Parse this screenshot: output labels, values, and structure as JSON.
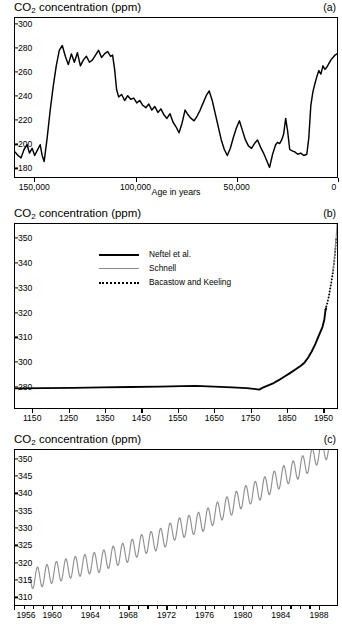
{
  "figure": {
    "background": "#ffffff",
    "line_color": "#000000",
    "secondary_line_color": "#8a8a8a"
  },
  "panels": [
    {
      "tag": "(a)",
      "axis_title_main": "CO",
      "axis_title_sub": "2",
      "axis_title_rest": " concentration (ppm)",
      "xlabel": "Age in years",
      "yticks": [
        "300",
        "280",
        "260",
        "240",
        "220",
        "200",
        "180"
      ],
      "xticks": [
        "150,000",
        "100,000",
        "50,000",
        "0"
      ]
    },
    {
      "tag": "(b)",
      "axis_title_main": "CO",
      "axis_title_sub": "2",
      "axis_title_rest": " concentration (ppm)",
      "xlabel": "",
      "yticks": [
        "350",
        "340",
        "330",
        "320",
        "310",
        "300",
        "280"
      ],
      "xticks": [
        "1150",
        "1250",
        "1350",
        "1450",
        "1550",
        "1650",
        "1750",
        "1850",
        "1950"
      ],
      "legend": [
        {
          "label": "Neftel et  al.",
          "style": "solid"
        },
        {
          "label": "Schnell",
          "style": "thin-gray"
        },
        {
          "label": "Bacastow and Keeling",
          "style": "dotted"
        }
      ]
    },
    {
      "tag": "(c)",
      "axis_title_main": "CO",
      "axis_title_sub": "2",
      "axis_title_rest": " concentration (ppm)",
      "xlabel": "",
      "yticks": [
        "350",
        "345",
        "340",
        "335",
        "330",
        "325",
        "320",
        "315",
        "310"
      ],
      "xticks": [
        "1956",
        "1960",
        "1964",
        "1968",
        "1972",
        "1976",
        "1980",
        "1984",
        "1988"
      ]
    }
  ],
  "chart_data": [
    {
      "type": "line",
      "panel": "(a)",
      "title": "CO2 concentration (ppm)",
      "xlabel": "Age in years",
      "ylabel": "CO2 concentration (ppm)",
      "xlim": [
        160000,
        0
      ],
      "ylim": [
        172,
        305
      ],
      "x_reversed": true,
      "grid": false,
      "legend": "none",
      "series": [
        {
          "name": "Vostok ice core CO2",
          "points": [
            [
              160000,
              193
            ],
            [
              158500,
              190
            ],
            [
              157000,
              188
            ],
            [
              155500,
              195
            ],
            [
              154000,
              199
            ],
            [
              152800,
              192
            ],
            [
              151500,
              196
            ],
            [
              150200,
              190
            ],
            [
              149000,
              194
            ],
            [
              147500,
              199
            ],
            [
              146500,
              190
            ],
            [
              145500,
              185
            ],
            [
              144000,
              205
            ],
            [
              142500,
              228
            ],
            [
              141000,
              248
            ],
            [
              139500,
              265
            ],
            [
              138000,
              278
            ],
            [
              136500,
              282
            ],
            [
              135000,
              273
            ],
            [
              133500,
              266
            ],
            [
              132000,
              275
            ],
            [
              130500,
              268
            ],
            [
              129000,
              276
            ],
            [
              127500,
              265
            ],
            [
              126000,
              270
            ],
            [
              124500,
              273
            ],
            [
              123000,
              268
            ],
            [
              121500,
              270
            ],
            [
              120000,
              274
            ],
            [
              118500,
              278
            ],
            [
              117000,
              272
            ],
            [
              115500,
              275
            ],
            [
              114000,
              277
            ],
            [
              112500,
              273
            ],
            [
              111500,
              274
            ],
            [
              110500,
              262
            ],
            [
              109500,
              245
            ],
            [
              108500,
              239
            ],
            [
              107000,
              241
            ],
            [
              105500,
              236
            ],
            [
              104000,
              240
            ],
            [
              102500,
              237
            ],
            [
              101000,
              238
            ],
            [
              99500,
              234
            ],
            [
              98000,
              236
            ],
            [
              96500,
              232
            ],
            [
              95000,
              230
            ],
            [
              93500,
              233
            ],
            [
              92000,
              228
            ],
            [
              90500,
              231
            ],
            [
              89000,
              226
            ],
            [
              87500,
              229
            ],
            [
              86000,
              224
            ],
            [
              84500,
              221
            ],
            [
              83000,
              225
            ],
            [
              81500,
              218
            ],
            [
              80000,
              214
            ],
            [
              78500,
              209
            ],
            [
              77000,
              217
            ],
            [
              75500,
              228
            ],
            [
              74000,
              224
            ],
            [
              72500,
              221
            ],
            [
              71000,
              219
            ],
            [
              69500,
              223
            ],
            [
              68000,
              228
            ],
            [
              66500,
              234
            ],
            [
              65000,
              240
            ],
            [
              63500,
              244
            ],
            [
              62000,
              236
            ],
            [
              60500,
              225
            ],
            [
              59000,
              214
            ],
            [
              57500,
              203
            ],
            [
              56000,
              195
            ],
            [
              54500,
              190
            ],
            [
              53000,
              196
            ],
            [
              51500,
              205
            ],
            [
              50000,
              213
            ],
            [
              48500,
              219
            ],
            [
              47000,
              211
            ],
            [
              45500,
              203
            ],
            [
              44000,
              198
            ],
            [
              42500,
              196
            ],
            [
              41000,
              200
            ],
            [
              39500,
              203
            ],
            [
              38000,
              197
            ],
            [
              36500,
              192
            ],
            [
              35000,
              186
            ],
            [
              33500,
              180
            ],
            [
              32000,
              191
            ],
            [
              30500,
              199
            ],
            [
              29500,
              201
            ],
            [
              28500,
              200
            ],
            [
              27500,
              203
            ],
            [
              26500,
              208
            ],
            [
              25500,
              221
            ],
            [
              24500,
              210
            ],
            [
              23500,
              195
            ],
            [
              22500,
              194
            ],
            [
              21000,
              193
            ],
            [
              19500,
              191
            ],
            [
              18000,
              192
            ],
            [
              16500,
              190
            ],
            [
              15000,
              191
            ],
            [
              14000,
              205
            ],
            [
              13000,
              232
            ],
            [
              12000,
              243
            ],
            [
              11000,
              250
            ],
            [
              10000,
              256
            ],
            [
              9000,
              261
            ],
            [
              8000,
              258
            ],
            [
              7000,
              265
            ],
            [
              6000,
              262
            ],
            [
              5000,
              264
            ],
            [
              4000,
              267
            ],
            [
              3000,
              270
            ],
            [
              2000,
              272
            ],
            [
              1000,
              274
            ],
            [
              0,
              275
            ]
          ]
        }
      ]
    },
    {
      "type": "line",
      "panel": "(b)",
      "title": "CO2 concentration (ppm)",
      "xlabel": "",
      "ylabel": "CO2 concentration (ppm)",
      "xlim": [
        1100,
        1990
      ],
      "ylim": [
        274,
        358
      ],
      "grid": false,
      "legend": "upper-left-inside",
      "series": [
        {
          "name": "Neftel et  al.",
          "style": "solid",
          "color": "#000000",
          "points": [
            [
              1100,
              278.2
            ],
            [
              1180,
              278.4
            ],
            [
              1260,
              278.6
            ],
            [
              1340,
              279.0
            ],
            [
              1420,
              279.3
            ],
            [
              1500,
              279.6
            ],
            [
              1560,
              280.0
            ],
            [
              1600,
              280.2
            ],
            [
              1650,
              279.6
            ],
            [
              1700,
              279.0
            ],
            [
              1740,
              278.4
            ],
            [
              1760,
              277.8
            ],
            [
              1775,
              277.2
            ],
            [
              1785,
              278.8
            ],
            [
              1800,
              280.6
            ],
            [
              1815,
              282.5
            ],
            [
              1830,
              285.0
            ],
            [
              1845,
              287.8
            ],
            [
              1860,
              290.5
            ],
            [
              1875,
              293.5
            ],
            [
              1890,
              296.5
            ],
            [
              1900,
              299.0
            ],
            [
              1910,
              301.5
            ],
            [
              1920,
              304.0
            ],
            [
              1930,
              307.0
            ],
            [
              1940,
              310.5
            ],
            [
              1950,
              314.0
            ],
            [
              1955,
              317.0
            ],
            [
              1958,
              320.5
            ],
            [
              1960,
              321.5
            ]
          ]
        },
        {
          "name": "Bacastow and Keeling",
          "style": "dotted",
          "color": "#000000",
          "points": [
            [
              1958,
              321.0
            ],
            [
              1961,
              322.5
            ],
            [
              1964,
              324.0
            ],
            [
              1967,
              326.0
            ],
            [
              1970,
              328.5
            ],
            [
              1973,
              331.0
            ],
            [
              1976,
              333.5
            ],
            [
              1979,
              336.5
            ],
            [
              1982,
              340.0
            ],
            [
              1985,
              344.5
            ],
            [
              1988,
              350.0
            ]
          ]
        },
        {
          "name": "Schnell",
          "style": "thin-gray",
          "color": "#8a8a8a",
          "points": [
            [
              1978,
              336.0
            ],
            [
              1980,
              338.0
            ],
            [
              1982,
              340.5
            ],
            [
              1984,
              343.5
            ],
            [
              1986,
              347.0
            ],
            [
              1988,
              351.0
            ],
            [
              1990,
              355.5
            ]
          ]
        }
      ]
    },
    {
      "type": "line",
      "panel": "(c)",
      "title": "CO2 concentration (ppm)",
      "xlabel": "",
      "ylabel": "CO2 concentration (ppm)",
      "xlim": [
        1956,
        1990
      ],
      "ylim": [
        307.5,
        352.5
      ],
      "grid": false,
      "legend": "none",
      "description": "Mauna Loa Keeling curve: rising trend with annual seasonal oscillation of about 6 ppm peak-to-peak.",
      "annual_means": [
        {
          "year": 1958,
          "value": 315.3
        },
        {
          "year": 1959,
          "value": 315.9
        },
        {
          "year": 1960,
          "value": 316.9
        },
        {
          "year": 1961,
          "value": 317.6
        },
        {
          "year": 1962,
          "value": 318.4
        },
        {
          "year": 1963,
          "value": 318.9
        },
        {
          "year": 1964,
          "value": 319.6
        },
        {
          "year": 1965,
          "value": 320.0
        },
        {
          "year": 1966,
          "value": 321.3
        },
        {
          "year": 1967,
          "value": 322.1
        },
        {
          "year": 1968,
          "value": 323.0
        },
        {
          "year": 1969,
          "value": 324.6
        },
        {
          "year": 1970,
          "value": 325.6
        },
        {
          "year": 1971,
          "value": 326.3
        },
        {
          "year": 1972,
          "value": 327.5
        },
        {
          "year": 1973,
          "value": 329.6
        },
        {
          "year": 1974,
          "value": 330.2
        },
        {
          "year": 1975,
          "value": 331.1
        },
        {
          "year": 1976,
          "value": 332.0
        },
        {
          "year": 1977,
          "value": 333.8
        },
        {
          "year": 1978,
          "value": 335.4
        },
        {
          "year": 1979,
          "value": 336.8
        },
        {
          "year": 1980,
          "value": 338.7
        },
        {
          "year": 1981,
          "value": 340.0
        },
        {
          "year": 1982,
          "value": 341.1
        },
        {
          "year": 1983,
          "value": 342.8
        },
        {
          "year": 1984,
          "value": 344.4
        },
        {
          "year": 1985,
          "value": 345.9
        },
        {
          "year": 1986,
          "value": 347.2
        },
        {
          "year": 1987,
          "value": 348.9
        },
        {
          "year": 1988,
          "value": 351.5
        },
        {
          "year": 1989,
          "value": 352.9
        }
      ],
      "seasonal_amplitude": 6.0,
      "seasonal_peak_month": 5
    }
  ]
}
